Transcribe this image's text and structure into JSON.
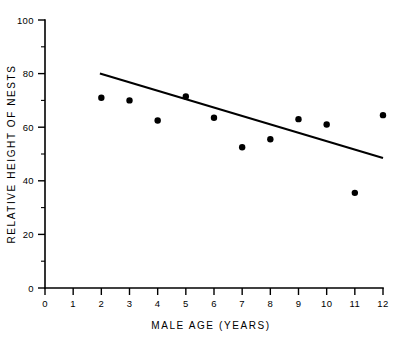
{
  "chart_data": {
    "type": "scatter",
    "title": "",
    "xlabel": "MALE AGE  (YEARS)",
    "ylabel": "RELATIVE HEIGHT OF NESTS",
    "xlim": [
      0,
      12
    ],
    "ylim": [
      0,
      100
    ],
    "grid": false,
    "legend": null,
    "x": [
      2,
      3,
      4,
      5,
      6,
      7,
      8,
      9,
      10,
      11,
      12
    ],
    "values": [
      71,
      70,
      62.5,
      71.5,
      63.5,
      52.5,
      55.5,
      63,
      61,
      35.5,
      64.5
    ],
    "series": [
      {
        "name": "Relative height of nests",
        "marker": "filled-circle",
        "points": [
          {
            "x": 2,
            "y": 71
          },
          {
            "x": 3,
            "y": 70
          },
          {
            "x": 4,
            "y": 62.5
          },
          {
            "x": 5,
            "y": 71.5
          },
          {
            "x": 6,
            "y": 63.5
          },
          {
            "x": 7,
            "y": 52.5
          },
          {
            "x": 8,
            "y": 55.5
          },
          {
            "x": 9,
            "y": 63
          },
          {
            "x": 10,
            "y": 61
          },
          {
            "x": 11,
            "y": 35.5
          },
          {
            "x": 12,
            "y": 64.5
          }
        ]
      }
    ],
    "trendline": {
      "name": "regression-line",
      "x_start": 1.95,
      "y_start": 80,
      "x_end": 12,
      "y_end": 48.5
    },
    "xticks": [
      0,
      1,
      2,
      3,
      4,
      5,
      6,
      7,
      8,
      9,
      10,
      11,
      12
    ],
    "xtick_labels": [
      "0",
      "1",
      "2",
      "3",
      "4",
      "5",
      "6",
      "7",
      "8",
      "9",
      "10",
      "11",
      "12"
    ],
    "yticks": [
      0,
      20,
      40,
      60,
      80,
      100
    ],
    "ytick_labels": [
      "0",
      "20",
      "40",
      "60",
      "80",
      "100"
    ],
    "yticks_minor": [
      10,
      30,
      50,
      70,
      90
    ]
  }
}
